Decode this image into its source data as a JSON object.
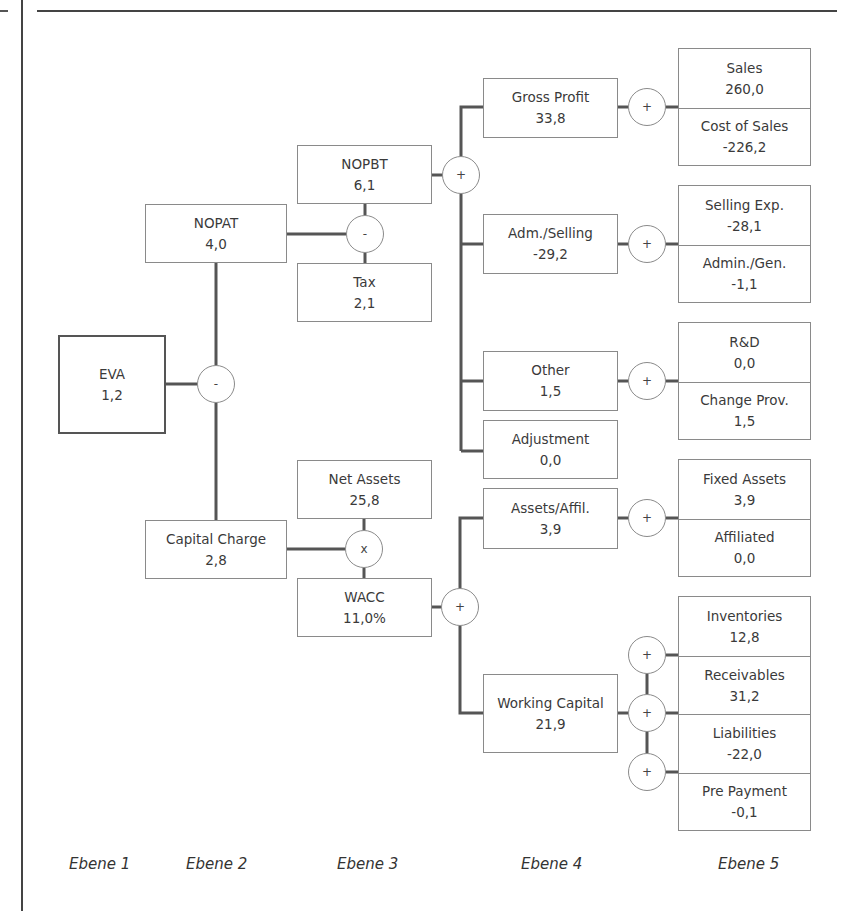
{
  "nodes": {
    "eva": {
      "label": "EVA",
      "value": "1,2"
    },
    "nopat": {
      "label": "NOPAT",
      "value": "4,0"
    },
    "capital_charge": {
      "label": "Capital Charge",
      "value": "2,8"
    },
    "nopbt": {
      "label": "NOPBT",
      "value": "6,1"
    },
    "tax": {
      "label": "Tax",
      "value": "2,1"
    },
    "net_assets": {
      "label": "Net Assets",
      "value": "25,8"
    },
    "wacc": {
      "label": "WACC",
      "value": "11,0%"
    },
    "gross_profit": {
      "label": "Gross Profit",
      "value": "33,8"
    },
    "adm_selling": {
      "label": "Adm./Selling",
      "value": "-29,2"
    },
    "other": {
      "label": "Other",
      "value": "1,5"
    },
    "adjustment": {
      "label": "Adjustment",
      "value": "0,0"
    },
    "assets_affil": {
      "label": "Assets/Affil.",
      "value": "3,9"
    },
    "working_capital": {
      "label": "Working Capital",
      "value": "21,9"
    },
    "sales": {
      "label": "Sales",
      "value": "260,0"
    },
    "cost_of_sales": {
      "label": "Cost of Sales",
      "value": "-226,2"
    },
    "selling_exp": {
      "label": "Selling Exp.",
      "value": "-28,1"
    },
    "admin_gen": {
      "label": "Admin./Gen.",
      "value": "-1,1"
    },
    "rnd": {
      "label": "R&D",
      "value": "0,0"
    },
    "change_prov": {
      "label": "Change Prov.",
      "value": "1,5"
    },
    "fixed_assets": {
      "label": "Fixed Assets",
      "value": "3,9"
    },
    "affiliated": {
      "label": "Affiliated",
      "value": "0,0"
    },
    "inventories": {
      "label": "Inventories",
      "value": "12,8"
    },
    "receivables": {
      "label": "Receivables",
      "value": "31,2"
    },
    "liabilities": {
      "label": "Liabilities",
      "value": "-22,0"
    },
    "pre_payment": {
      "label": "Pre Payment",
      "value": "-0,1"
    }
  },
  "operators": {
    "eva_op": "-",
    "nopat_op": "-",
    "capital_charge_op": "x",
    "nopbt_op": "+",
    "wacc_op": "+",
    "gross_profit_op": "+",
    "adm_selling_op": "+",
    "other_op": "+",
    "assets_affil_op": "+",
    "wc_op_1": "+",
    "wc_op_2": "+",
    "wc_op_3": "+"
  },
  "levels": [
    "Ebene 1",
    "Ebene 2",
    "Ebene 3",
    "Ebene 4",
    "Ebene 5"
  ],
  "colors": {
    "line": "#555555",
    "box_border": "#8a8a8a",
    "text": "#3a3a3a"
  }
}
